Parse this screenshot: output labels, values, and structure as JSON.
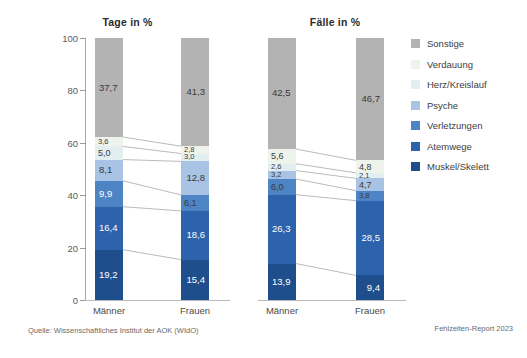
{
  "figure": {
    "source_note": "Quelle: Wissenschaftliches Institut der AOK (WIdO)",
    "report_note": "Fehlzeiten-Report 2023"
  },
  "legend": {
    "position": "right",
    "items": [
      {
        "label": "Sonstige",
        "color": "#b3b3b3"
      },
      {
        "label": "Verdauung",
        "color": "#eef4ec"
      },
      {
        "label": "Herz/Kreislauf",
        "color": "#e2eef0"
      },
      {
        "label": "Psyche",
        "color": "#a8c3e4"
      },
      {
        "label": "Verletzungen",
        "color": "#4d84c4"
      },
      {
        "label": "Atemwege",
        "color": "#2d63ac"
      },
      {
        "label": "Muskel/Skelett",
        "color": "#1f4e8c"
      }
    ]
  },
  "chart_data": {
    "type": "bar",
    "subtype": "stacked-percentage",
    "title": "",
    "xlabel": "",
    "ylabel": "",
    "ylim": [
      0,
      100
    ],
    "yticks": [
      0,
      20,
      40,
      60,
      80,
      100
    ],
    "ytick_labels": [
      "0",
      "20",
      "40",
      "60",
      "80",
      "100"
    ],
    "grid": false,
    "legend_position": "right",
    "panels": [
      {
        "title": "Tage in %",
        "categories": [
          "Männer",
          "Frauen"
        ],
        "series": [
          {
            "name": "Muskel/Skelett",
            "color": "#1f4e8c",
            "values": [
              19.2,
              15.4
            ],
            "labels": [
              "19,2",
              "15,4"
            ]
          },
          {
            "name": "Atemwege",
            "color": "#2d63ac",
            "values": [
              16.4,
              18.6
            ],
            "labels": [
              "16,4",
              "18,6"
            ]
          },
          {
            "name": "Verletzungen",
            "color": "#4d84c4",
            "values": [
              9.9,
              6.1
            ],
            "labels": [
              "9,9",
              "6,1"
            ]
          },
          {
            "name": "Psyche",
            "color": "#a8c3e4",
            "values": [
              8.1,
              12.8
            ],
            "labels": [
              "8,1",
              "12,8"
            ]
          },
          {
            "name": "Herz/Kreislauf",
            "color": "#e2eef0",
            "values": [
              5.0,
              3.0
            ],
            "labels": [
              "5,0",
              "3,0"
            ]
          },
          {
            "name": "Verdauung",
            "color": "#eef4ec",
            "values": [
              3.6,
              2.8
            ],
            "labels": [
              "3,6",
              "2,8"
            ]
          },
          {
            "name": "Sonstige",
            "color": "#b3b3b3",
            "values": [
              37.7,
              41.3
            ],
            "labels": [
              "37,7",
              "41,3"
            ]
          }
        ]
      },
      {
        "title": "Fälle in %",
        "categories": [
          "Männer",
          "Frauen"
        ],
        "series": [
          {
            "name": "Muskel/Skelett",
            "color": "#1f4e8c",
            "values": [
              13.9,
              9.4
            ],
            "labels": [
              "13,9",
              "9,4"
            ]
          },
          {
            "name": "Atemwege",
            "color": "#2d63ac",
            "values": [
              26.3,
              28.5
            ],
            "labels": [
              "26,3",
              "28,5"
            ]
          },
          {
            "name": "Verletzungen",
            "color": "#4d84c4",
            "values": [
              6.0,
              3.8
            ],
            "labels": [
              "6,0",
              "3,8"
            ]
          },
          {
            "name": "Psyche",
            "color": "#a8c3e4",
            "values": [
              3.2,
              4.7
            ],
            "labels": [
              "3,2",
              "4,7"
            ]
          },
          {
            "name": "Herz/Kreislauf",
            "color": "#e2eef0",
            "values": [
              2.6,
              2.1
            ],
            "labels": [
              "2,6",
              "2,1"
            ]
          },
          {
            "name": "Verdauung",
            "color": "#eef4ec",
            "values": [
              5.6,
              4.8
            ],
            "labels": [
              "5,6",
              "4,8"
            ]
          },
          {
            "name": "Sonstige",
            "color": "#b3b3b3",
            "values": [
              42.5,
              46.7
            ],
            "labels": [
              "42,5",
              "46,7"
            ]
          }
        ]
      }
    ]
  }
}
